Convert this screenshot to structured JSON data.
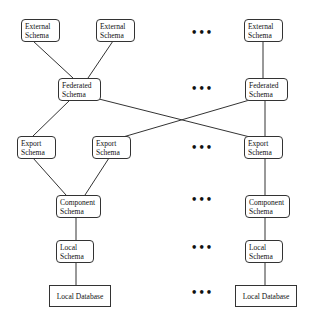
{
  "diagram": {
    "type": "federated-database-schema-architecture",
    "nodes": [
      {
        "id": "ext1",
        "label_line1": "External",
        "label_line2": "Schema",
        "x": 21,
        "y": 19,
        "w": 39,
        "h": 23
      },
      {
        "id": "ext2",
        "label_line1": "External",
        "label_line2": "Schema",
        "x": 96,
        "y": 19,
        "w": 39,
        "h": 23
      },
      {
        "id": "ext3",
        "label_line1": "External",
        "label_line2": "Schema",
        "x": 244,
        "y": 19,
        "w": 39,
        "h": 23
      },
      {
        "id": "fed1",
        "label_line1": "Federated",
        "label_line2": "Schema",
        "x": 58,
        "y": 78,
        "w": 43,
        "h": 23
      },
      {
        "id": "fed2",
        "label_line1": "Federated",
        "label_line2": "Schema",
        "x": 245,
        "y": 78,
        "w": 43,
        "h": 23
      },
      {
        "id": "exp1",
        "label_line1": "Export",
        "label_line2": "Schema",
        "x": 17,
        "y": 136,
        "w": 39,
        "h": 23
      },
      {
        "id": "exp2",
        "label_line1": "Export",
        "label_line2": "Schema",
        "x": 92,
        "y": 136,
        "w": 39,
        "h": 23
      },
      {
        "id": "exp3",
        "label_line1": "Export",
        "label_line2": "Schema",
        "x": 244,
        "y": 136,
        "w": 39,
        "h": 23
      },
      {
        "id": "comp1",
        "label_line1": "Component",
        "label_line2": "Schema",
        "x": 56,
        "y": 195,
        "w": 45,
        "h": 23
      },
      {
        "id": "comp2",
        "label_line1": "Component",
        "label_line2": "Schema",
        "x": 245,
        "y": 195,
        "w": 45,
        "h": 23
      },
      {
        "id": "loc1",
        "label_line1": "Local",
        "label_line2": "Schema",
        "x": 56,
        "y": 240,
        "w": 38,
        "h": 23
      },
      {
        "id": "loc2",
        "label_line1": "Local",
        "label_line2": "Schema",
        "x": 245,
        "y": 240,
        "w": 38,
        "h": 23
      },
      {
        "id": "db1",
        "label_line1": "Local Database",
        "label_line2": "",
        "x": 49,
        "y": 285,
        "w": 62,
        "h": 22
      },
      {
        "id": "db2",
        "label_line1": "Local Database",
        "label_line2": "",
        "x": 235,
        "y": 285,
        "w": 62,
        "h": 22
      }
    ],
    "edges": [
      [
        "ext1",
        "fed1"
      ],
      [
        "ext2",
        "fed1"
      ],
      [
        "ext3",
        "fed2"
      ],
      [
        "fed1",
        "exp1"
      ],
      [
        "fed1",
        "exp3"
      ],
      [
        "fed2",
        "exp2"
      ],
      [
        "fed2",
        "exp3"
      ],
      [
        "exp1",
        "comp1"
      ],
      [
        "exp2",
        "comp1"
      ],
      [
        "exp3",
        "comp2"
      ],
      [
        "comp1",
        "loc1"
      ],
      [
        "comp2",
        "loc2"
      ],
      [
        "loc1",
        "db1"
      ],
      [
        "loc2",
        "db2"
      ]
    ],
    "ellipsis": {
      "symbol": "•••",
      "x": 191,
      "rows_y": [
        29,
        85,
        144,
        196,
        244,
        289
      ]
    }
  }
}
